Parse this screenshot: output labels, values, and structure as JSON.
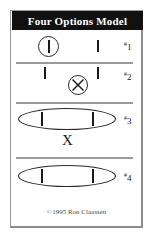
{
  "card": {
    "title": "Four Options Model",
    "copyright": "©1995 Ron Claassen"
  },
  "rows": [
    {
      "number": "1",
      "hash": "#",
      "label_full": "#1",
      "description": "circled vertical bar on the left, separate vertical bar on the right"
    },
    {
      "number": "2",
      "hash": "#",
      "label_full": "#2",
      "description": "two separate vertical bars with a circled X between and below them"
    },
    {
      "number": "3",
      "hash": "#",
      "label_full": "#3",
      "description": "ellipse enclosing two vertical bars, with an X below the ellipse",
      "x_glyph": "X"
    },
    {
      "number": "4",
      "hash": "#",
      "label_full": "#4",
      "description": "ellipse enclosing two vertical bars"
    }
  ],
  "icons": {
    "circle_bar": "circle-with-bar",
    "circle_x": "circle-with-x",
    "ellipse_bars": "ellipse-with-two-bars",
    "bar": "vertical-bar",
    "x": "x-mark"
  },
  "colors": {
    "banner_bg": "#111111",
    "banner_text": "#ffffff",
    "card_bg": "#ffffff",
    "card_border": "#9a9a9a",
    "ink": "#1a1a1a",
    "separator": "#9a9a9a",
    "footer_text": "#4a4a4a"
  }
}
